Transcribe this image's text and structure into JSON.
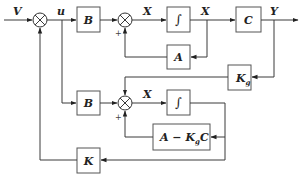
{
  "diagram": {
    "type": "control-system-block-diagram",
    "signals": {
      "input": "V",
      "control": "u",
      "state_top": "X",
      "state_top_out": "X",
      "output": "Y",
      "state_bottom": "X"
    },
    "blocks": {
      "b_top": "B",
      "integrator_top": "∫",
      "a_feedback": "A",
      "c_output": "C",
      "kg_main": "K",
      "kg_sub": "g",
      "b_bottom": "B",
      "integrator_bottom": "∫",
      "observer_a": "A − K",
      "observer_sub": "g",
      "observer_c": "C",
      "k_feedback": "K"
    },
    "signs": {
      "sum2_plus": "+",
      "sum3_plus": "+"
    },
    "colors": {
      "line": "#3a3a3a",
      "block_border": "#555555",
      "text": "#222222",
      "background": "#ffffff"
    }
  }
}
